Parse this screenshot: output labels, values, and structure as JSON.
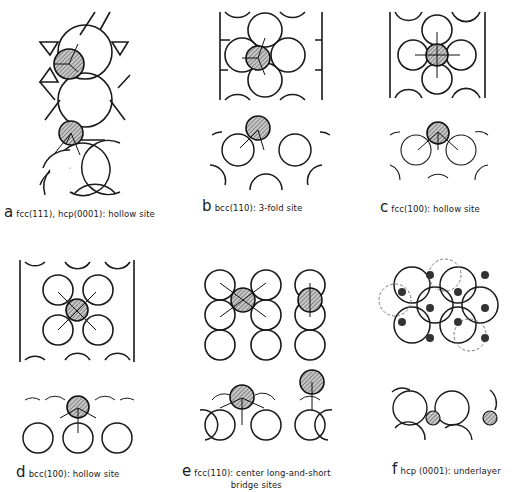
{
  "figure": {
    "panels": [
      {
        "id": "a",
        "letter": "a",
        "text": "fcc(111), hcp(0001): hollow site",
        "line2": ""
      },
      {
        "id": "b",
        "letter": "b",
        "text": "bcc(110): 3-fold site",
        "line2": ""
      },
      {
        "id": "c",
        "letter": "c",
        "text": "fcc(100): hollow site",
        "line2": ""
      },
      {
        "id": "d",
        "letter": "d",
        "text": "bcc(100): hollow site",
        "line2": ""
      },
      {
        "id": "e",
        "letter": "e",
        "text": "fcc(110): center long-and-short",
        "line2": "bridge sites"
      },
      {
        "id": "f",
        "letter": "f",
        "text": "hcp (0001): underlayer",
        "line2": ""
      }
    ],
    "colors": {
      "line": "#1a1a1a",
      "adsorbate_fill": "#9a9a9a",
      "background": "#ffffff"
    }
  }
}
